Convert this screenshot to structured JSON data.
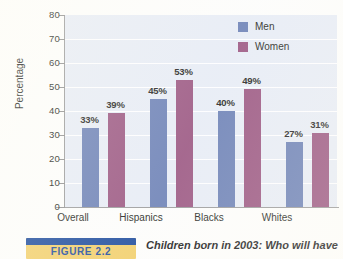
{
  "chart_data": {
    "type": "bar",
    "title": "",
    "subtitle": "",
    "xlabel": "",
    "ylabel": "Percentage",
    "ylim": [
      0,
      80
    ],
    "yticks": [
      0,
      10,
      20,
      30,
      40,
      50,
      60,
      70,
      80
    ],
    "ytick_labels": [
      "0",
      "10",
      "20",
      "30",
      "40",
      "50",
      "60",
      "70",
      "80"
    ],
    "grid": true,
    "legend_position": "top-right",
    "categories": [
      "Overall",
      "Hispanics",
      "Blacks",
      "Whites"
    ],
    "series": [
      {
        "name": "Men",
        "color": "#6b80b5",
        "values": [
          33,
          45,
          40,
          27
        ],
        "labels": [
          "33%",
          "39%",
          "45%",
          "27%"
        ]
      },
      {
        "name": "Women",
        "color": "#9a5580",
        "values": [
          39,
          53,
          49,
          31
        ],
        "labels": [
          "39%",
          "53%",
          "49%",
          "31%"
        ]
      }
    ],
    "point_labels": {
      "Overall": {
        "Men": "33%",
        "Women": "39%"
      },
      "Hispanics": {
        "Men": "45%",
        "Women": "53%"
      },
      "Blacks": {
        "Men": "40%",
        "Women": "49%"
      },
      "Whites": {
        "Men": "27%",
        "Women": "31%"
      }
    },
    "annotations": []
  },
  "legend": {
    "items": [
      {
        "label": "Men",
        "color": "#6b80b5"
      },
      {
        "label": "Women",
        "color": "#9a5580"
      }
    ]
  },
  "axes": {
    "y_title": "Percentage",
    "y_labels": [
      "80",
      "70",
      "60",
      "50",
      "40",
      "30",
      "20",
      "10",
      "0"
    ],
    "x_labels": [
      "Overall",
      "Hispanics",
      "Blacks",
      "Whites"
    ]
  },
  "bars": [
    {
      "group": "Overall",
      "series": "Men",
      "label": "33%",
      "value": 33
    },
    {
      "group": "Overall",
      "series": "Women",
      "label": "39%",
      "value": 39
    },
    {
      "group": "Hispanics",
      "series": "Men",
      "label": "45%",
      "value": 45
    },
    {
      "group": "Hispanics",
      "series": "Women",
      "label": "53%",
      "value": 53
    },
    {
      "group": "Blacks",
      "series": "Men",
      "label": "40%",
      "value": 40
    },
    {
      "group": "Blacks",
      "series": "Women",
      "label": "49%",
      "value": 49
    },
    {
      "group": "Whites",
      "series": "Men",
      "label": "27%",
      "value": 27
    },
    {
      "group": "Whites",
      "series": "Women",
      "label": "31%",
      "value": 31
    }
  ],
  "figure": {
    "badge_label": "FIGURE 2.2",
    "caption": "Children born in 2003: Who will have"
  },
  "colors": {
    "men": "#6b80b5",
    "women": "#9a5580",
    "plot_background": "#e7ecf5",
    "gridline": "#ffffff",
    "axis": "#9a9a9a",
    "badge_blue": "#1d4b9c",
    "badge_gold": "#f2cf6a"
  }
}
